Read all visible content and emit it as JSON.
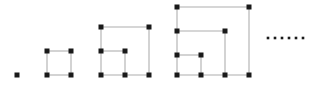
{
  "diagram": {
    "continuation_symbol": "......",
    "style": {
      "background_color": "#ffffff",
      "edge_color": "#c8c8c8",
      "vertex_color": "#1a1a1a",
      "vertex_size_px": 5,
      "edge_width_px": 1.6,
      "grid_step_px": 24
    },
    "ellipsis": {
      "label": "ellipsis",
      "dot_count": 6,
      "dot_size_px": 2.6,
      "y": 38,
      "x_start": 268,
      "x_spacing": 7
    },
    "figures": [
      {
        "index": 1,
        "label": "n = 1",
        "order": 1,
        "vertex_count": 1,
        "edge_count": 0,
        "vertices": [
          {
            "x": 17,
            "y": 75
          }
        ],
        "edges": []
      },
      {
        "index": 2,
        "label": "n = 2",
        "order": 2,
        "vertex_count": 4,
        "edge_count": 4,
        "vertices": [
          {
            "x": 47,
            "y": 51
          },
          {
            "x": 71,
            "y": 51
          },
          {
            "x": 47,
            "y": 75
          },
          {
            "x": 71,
            "y": 75
          }
        ],
        "edges": [
          {
            "x1": 47,
            "y1": 51,
            "x2": 71,
            "y2": 51
          },
          {
            "x1": 71,
            "y1": 51,
            "x2": 71,
            "y2": 75
          },
          {
            "x1": 71,
            "y1": 75,
            "x2": 47,
            "y2": 75
          },
          {
            "x1": 47,
            "y1": 75,
            "x2": 47,
            "y2": 51
          }
        ]
      },
      {
        "index": 3,
        "label": "n = 3",
        "order": 3,
        "vertex_count": 7,
        "edge_count": 8,
        "vertices": [
          {
            "x": 101,
            "y": 27
          },
          {
            "x": 149,
            "y": 27
          },
          {
            "x": 101,
            "y": 51
          },
          {
            "x": 125,
            "y": 51
          },
          {
            "x": 101,
            "y": 75
          },
          {
            "x": 125,
            "y": 75
          },
          {
            "x": 149,
            "y": 75
          }
        ],
        "edges": [
          {
            "x1": 101,
            "y1": 27,
            "x2": 149,
            "y2": 27
          },
          {
            "x1": 149,
            "y1": 27,
            "x2": 149,
            "y2": 75
          },
          {
            "x1": 101,
            "y1": 75,
            "x2": 149,
            "y2": 75
          },
          {
            "x1": 101,
            "y1": 27,
            "x2": 101,
            "y2": 75
          },
          {
            "x1": 101,
            "y1": 51,
            "x2": 125,
            "y2": 51
          },
          {
            "x1": 125,
            "y1": 51,
            "x2": 125,
            "y2": 75
          }
        ]
      },
      {
        "index": 4,
        "label": "n = 4",
        "order": 4,
        "vertex_count": 10,
        "edge_count": 12,
        "vertices": [
          {
            "x": 177,
            "y": 7
          },
          {
            "x": 249,
            "y": 7
          },
          {
            "x": 177,
            "y": 31
          },
          {
            "x": 225,
            "y": 31
          },
          {
            "x": 177,
            "y": 55
          },
          {
            "x": 201,
            "y": 55
          },
          {
            "x": 177,
            "y": 75
          },
          {
            "x": 201,
            "y": 75
          },
          {
            "x": 225,
            "y": 75
          },
          {
            "x": 249,
            "y": 75
          }
        ],
        "edges": [
          {
            "x1": 177,
            "y1": 7,
            "x2": 249,
            "y2": 7
          },
          {
            "x1": 249,
            "y1": 7,
            "x2": 249,
            "y2": 75
          },
          {
            "x1": 177,
            "y1": 75,
            "x2": 249,
            "y2": 75
          },
          {
            "x1": 177,
            "y1": 7,
            "x2": 177,
            "y2": 75
          },
          {
            "x1": 177,
            "y1": 31,
            "x2": 225,
            "y2": 31
          },
          {
            "x1": 225,
            "y1": 31,
            "x2": 225,
            "y2": 75
          },
          {
            "x1": 177,
            "y1": 55,
            "x2": 201,
            "y2": 55
          },
          {
            "x1": 201,
            "y1": 55,
            "x2": 201,
            "y2": 75
          }
        ]
      }
    ]
  }
}
